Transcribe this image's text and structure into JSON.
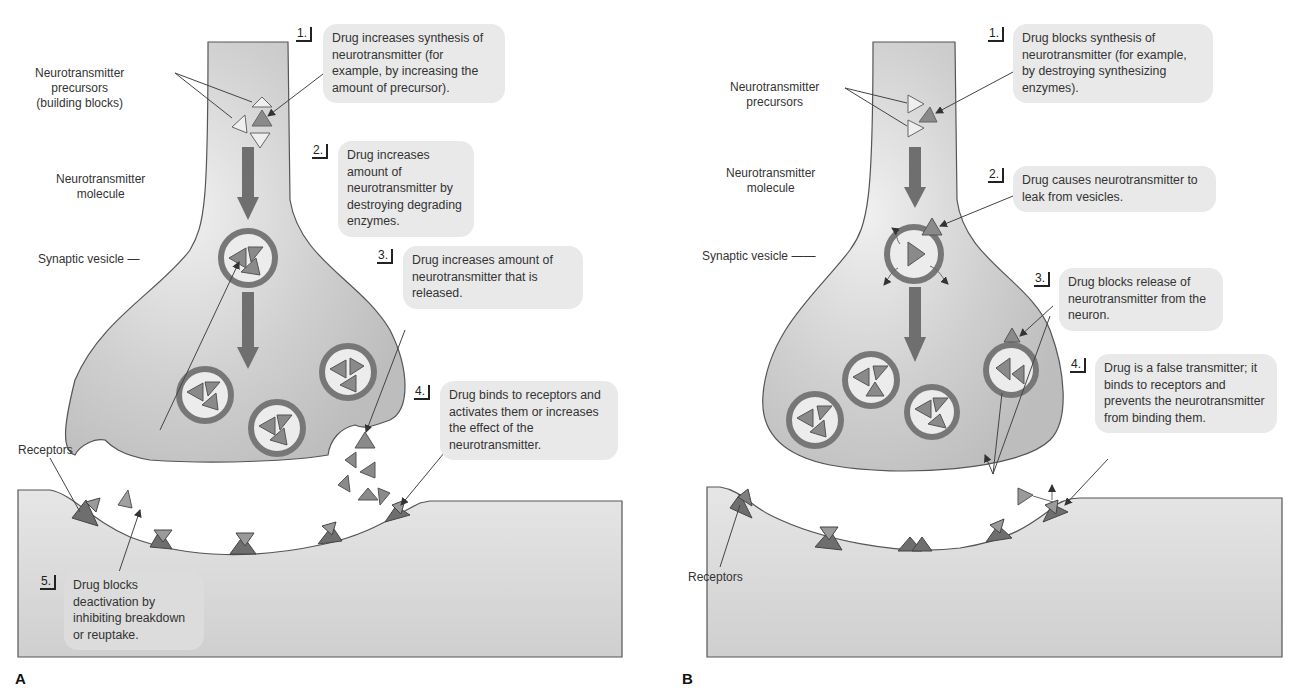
{
  "panels": {
    "A": {
      "letter": "A",
      "labels": {
        "precursors_line1": "Neurotransmitter",
        "precursors_line2": "precursors",
        "precursors_line3": "(building blocks)",
        "molecule_line1": "Neurotransmitter",
        "molecule_line2": "molecule",
        "vesicle": "Synaptic vesicle",
        "receptors": "Receptors"
      },
      "callouts": [
        {
          "number": "1.",
          "text": "Drug increases synthesis of neurotransmitter (for example, by increasing the amount of precursor)."
        },
        {
          "number": "2.",
          "text": "Drug increases amount of neurotransmitter by destroying degrading enzymes."
        },
        {
          "number": "3.",
          "text": "Drug increases amount of neurotransmitter that is released."
        },
        {
          "number": "4.",
          "text": "Drug binds to receptors and activates them or increases the effect of the neurotransmitter."
        },
        {
          "number": "5.",
          "text": "Drug blocks deactivation by inhibiting breakdown or reuptake."
        }
      ]
    },
    "B": {
      "letter": "B",
      "labels": {
        "precursors_line1": "Neurotransmitter",
        "precursors_line2": "precursors",
        "molecule_line1": "Neurotransmitter",
        "molecule_line2": "molecule",
        "vesicle": "Synaptic vesicle",
        "receptors": "Receptors"
      },
      "callouts": [
        {
          "number": "1.",
          "text": "Drug blocks synthesis of neurotransmitter (for example, by destroying synthesizing enzymes)."
        },
        {
          "number": "2.",
          "text": "Drug causes neurotransmitter to leak from vesicles."
        },
        {
          "number": "3.",
          "text": "Drug blocks release of neurotransmitter from the neuron."
        },
        {
          "number": "4.",
          "text": "Drug is a false transmitter; it binds to receptors and prevents the neurotransmitter from binding them."
        }
      ]
    }
  },
  "colors": {
    "neuron_fill": "#c9c9c9",
    "neuron_stroke": "#555555",
    "postsynaptic_fill": "#dedede",
    "callout_bg": "#e9e9e9",
    "arrow_fill": "#6f6f6f",
    "molecule_fill": "#8a8a8a",
    "receptor_fill": "#6e6e6e",
    "precursor_fill": "#efefef"
  }
}
